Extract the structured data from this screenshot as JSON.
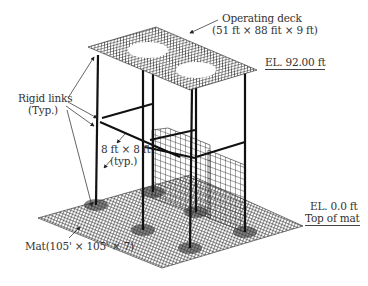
{
  "figure": {
    "labels": {
      "operating_deck": "Operating deck",
      "deck_dims": "(51 ft × 88 fit × 9 ft)",
      "el_top": "EL. 92.00 ft",
      "rigid_links": "Rigid links",
      "rigid_links_typ": "(Typ.)",
      "beam_size": "8 ft × 8 ft",
      "beam_typ": "(typ.)",
      "el_bottom": "EL. 0.0 ft",
      "top_of_mat": "Top of mat",
      "mat": "Mat(105' × 105' × 7)"
    },
    "colors": {
      "mesh": "#222222",
      "column": "#111111",
      "text": "#333333",
      "background": "#ffffff"
    }
  }
}
